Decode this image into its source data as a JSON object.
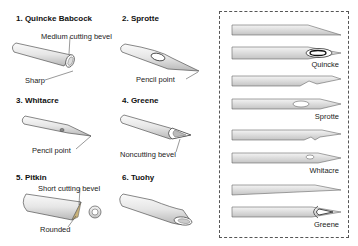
{
  "panels": [
    {
      "id": 1,
      "title": "1. Quincke Babcock",
      "labels": [
        "Medium cutting bevel",
        "Sharp"
      ]
    },
    {
      "id": 2,
      "title": "2. Sprotte",
      "labels": [
        "Pencil point"
      ]
    },
    {
      "id": 3,
      "title": "3. Whitacre",
      "labels": [
        "Pencil point"
      ]
    },
    {
      "id": 4,
      "title": "4. Greene",
      "labels": [
        "Noncutting bevel"
      ]
    },
    {
      "id": 5,
      "title": "5. Pitkin",
      "labels": [
        "Short cutting bevel",
        "Rounded"
      ]
    },
    {
      "id": 6,
      "title": "6. Tuohy",
      "labels": []
    }
  ],
  "side_comparison": {
    "border_style": "dashed",
    "items": [
      {
        "name": "Quincke"
      },
      {
        "name": "Sprotte"
      },
      {
        "name": "Whitacre"
      },
      {
        "name": "Greene"
      }
    ]
  },
  "colors": {
    "needle_fill_light": "#f2f2f2",
    "needle_fill_dark": "#bdbdbd",
    "outline": "#555555",
    "box_border": "#555555"
  }
}
